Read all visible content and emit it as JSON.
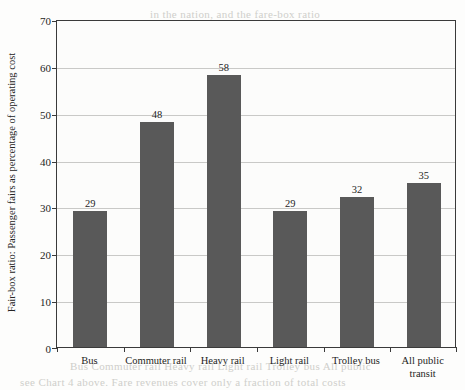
{
  "chart_data": {
    "type": "bar",
    "title": "",
    "xlabel": "",
    "ylabel": "Fair-box ratio: Passenger fairs as percentage of operating cost",
    "categories": [
      "Bus",
      "Commuter rail",
      "Heavy rail",
      "Light rail",
      "Trolley bus",
      "All public transit"
    ],
    "values": [
      29,
      48,
      58,
      29,
      32,
      35
    ],
    "value_labels": [
      "29",
      "48",
      "58",
      "29",
      "32",
      "35"
    ],
    "ylim": [
      0,
      70
    ],
    "yticks": [
      0,
      10,
      20,
      30,
      40,
      50,
      60,
      70
    ],
    "ytick_labels": [
      "0",
      "10",
      "20",
      "30",
      "40",
      "50",
      "60",
      "70"
    ],
    "grid": true,
    "legend": false,
    "bar_color": "#595959",
    "plot_background": "#fcfcfb",
    "axis_color": "#3a3a3a",
    "gridline_color": "#c9c9c7"
  },
  "bleed_text": [
    "in the nation, and the fare-box ratio",
    "number of passengers carried by the",
    "transit systems. The efficiency of transit",
    "measure of operating costs",
    "cover operating costs",
    "Light rail",
    "the fare-box recovery ratio varies widely by mode",
    "percent for commuter rail to about 58 percent",
    "transit systems the average",
    "for heavy rail. The national average for all public",
    "transit systems is about 35 percent",
    "much of the cost of public transit service",
    "Bus   Commuter rail   Heavy rail   Light rail   Trolley bus   All public",
    "see Chart 4 above. Fare revenues cover only a fraction of total costs"
  ]
}
